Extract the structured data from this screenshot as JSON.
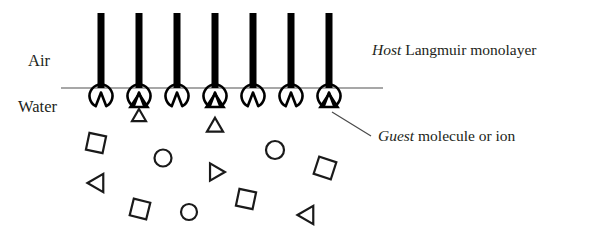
{
  "figure": {
    "background_color": "#ffffff",
    "ink_color": "#000000",
    "interface_color": "#8a8a8a"
  },
  "labels": {
    "air": "Air",
    "water": "Water",
    "host_emphasis": "Host",
    "host_rest": " Langmuir monolayer",
    "guest_emphasis": "Guest",
    "guest_rest": " molecule  or ion"
  },
  "interface": {
    "y": 88,
    "x_start": 61,
    "x_end": 383
  },
  "host_molecules": {
    "count": 7,
    "tail_top": 13,
    "tail_bottom": 88,
    "tail_width": 7,
    "head_center_y": 96,
    "head_radius": 11.5,
    "x_positions": [
      101,
      139,
      177,
      215,
      253,
      291,
      329
    ],
    "bound_guest_indices": [
      1,
      3,
      6
    ]
  },
  "free_guests": [
    {
      "shape": "triangle",
      "x": 139,
      "y": 117,
      "size": 13,
      "rotation": 0
    },
    {
      "shape": "triangle",
      "x": 215,
      "y": 127,
      "size": 15,
      "rotation": 0
    },
    {
      "shape": "square",
      "x": 96,
      "y": 143,
      "size": 17,
      "rotation": 12
    },
    {
      "shape": "circle",
      "x": 163,
      "y": 158,
      "size": 17,
      "rotation": 0
    },
    {
      "shape": "circle",
      "x": 275,
      "y": 150,
      "size": 18,
      "rotation": 0
    },
    {
      "shape": "triangle",
      "x": 215,
      "y": 172,
      "size": 16,
      "rotation": 90
    },
    {
      "shape": "square",
      "x": 325,
      "y": 168,
      "size": 18,
      "rotation": 18
    },
    {
      "shape": "triangle",
      "x": 98,
      "y": 183,
      "size": 17,
      "rotation": -90
    },
    {
      "shape": "square",
      "x": 246,
      "y": 199,
      "size": 17,
      "rotation": 12
    },
    {
      "shape": "square",
      "x": 140,
      "y": 209,
      "size": 17,
      "rotation": 14
    },
    {
      "shape": "circle",
      "x": 189,
      "y": 212,
      "size": 16,
      "rotation": 0
    },
    {
      "shape": "triangle",
      "x": 308,
      "y": 215,
      "size": 17,
      "rotation": -90
    }
  ],
  "annotations": {
    "host_label_x": 372,
    "host_label_y": 55,
    "guest_label_x": 378,
    "guest_label_y": 141,
    "air_label_x": 28,
    "air_label_y": 66,
    "water_label_x": 18,
    "water_label_y": 112,
    "leader_from_x": 332,
    "leader_from_y": 112,
    "leader_to_x": 371,
    "leader_to_y": 136
  }
}
